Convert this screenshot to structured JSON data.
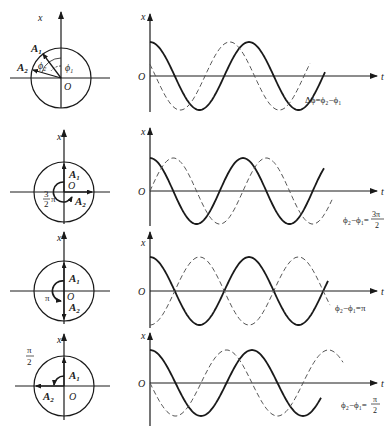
{
  "colors": {
    "ink": "#1a1a1a",
    "dash": "#555555",
    "background": "#ffffff"
  },
  "axes": {
    "x_label": "x",
    "t_label": "t",
    "origin_label": "O"
  },
  "rows": [
    {
      "id": "general",
      "phasor": {
        "A1_label": "A",
        "A1_sub": "1",
        "A2_label": "A",
        "A2_sub": "2",
        "phi1_label": "ϕ",
        "phi1_sub": "1",
        "phi2_label": "ϕ",
        "phi2_sub": "2"
      },
      "caption": "Δϕ=ϕ₂−ϕ₁",
      "solid_phase_deg": 0,
      "dashed_phase_deg": 70
    },
    {
      "id": "three-half-pi",
      "phasor": {
        "A1_label": "A",
        "A1_sub": "1",
        "A2_label": "A",
        "A2_sub": "2",
        "angle_num": "3",
        "angle_den": "2",
        "angle_pi": "π"
      },
      "caption": "ϕ₂−ϕ₁=3π/2",
      "caption_parts": {
        "lhs": "ϕ₂−ϕ₁=",
        "num": "3π",
        "den": "2"
      },
      "solid_phase_deg": 0,
      "dashed_phase_deg": 270
    },
    {
      "id": "pi",
      "phasor": {
        "A1_label": "A",
        "A1_sub": "1",
        "A2_label": "A",
        "A2_sub": "2",
        "angle_label": "π"
      },
      "caption": "ϕ₂−ϕ₁=π",
      "solid_phase_deg": 0,
      "dashed_phase_deg": 180
    },
    {
      "id": "half-pi",
      "phasor": {
        "A1_label": "A",
        "A1_sub": "1",
        "A2_label": "A",
        "A2_sub": "2",
        "angle_num": "π",
        "angle_den": "2"
      },
      "caption": "ϕ₂−ϕ₁=π/2",
      "caption_parts": {
        "lhs": "ϕ₂−ϕ₁=",
        "num": "π",
        "den": "2"
      },
      "solid_phase_deg": 0,
      "dashed_phase_deg": 90
    }
  ]
}
